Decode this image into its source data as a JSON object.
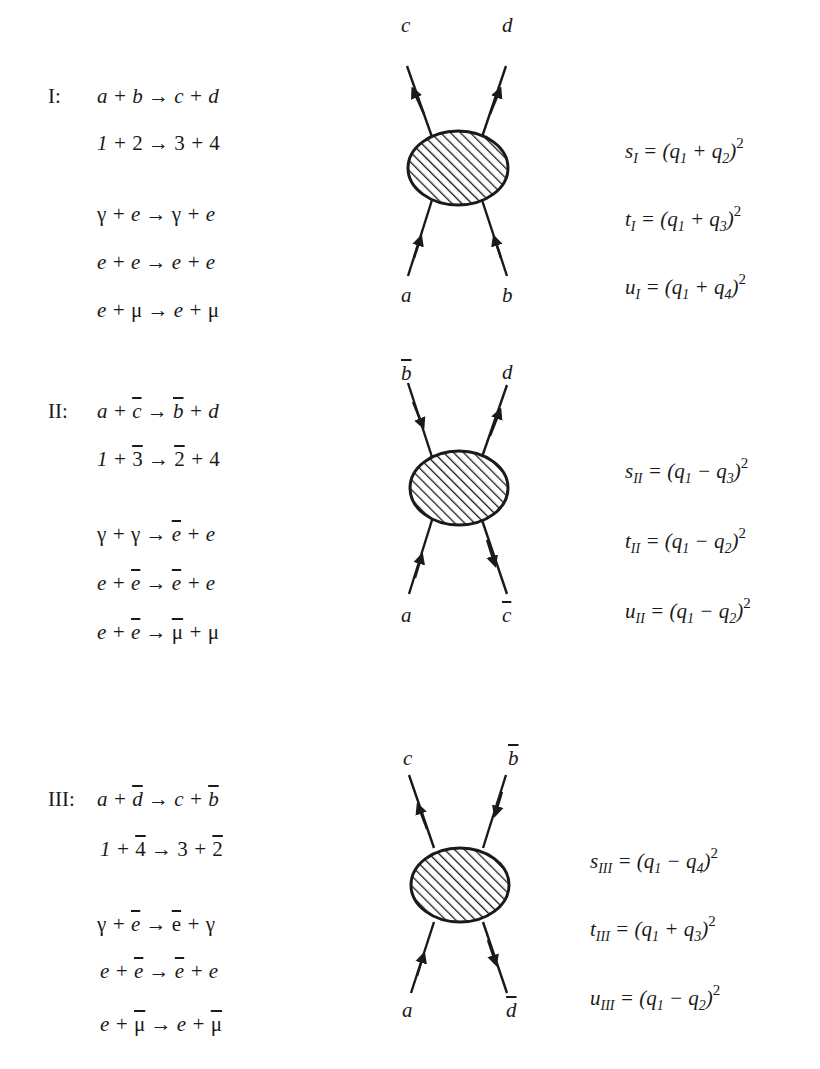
{
  "sections": [
    {
      "id": "I",
      "label": "I:",
      "equations": {
        "generic": "a + b → c + d",
        "numbered": "1 + 2 → 3 + 4",
        "examples": [
          "γ + e → γ + e",
          "e + e → e + e",
          "e + μ → e + μ"
        ]
      },
      "diagram": {
        "top_left": "c",
        "top_right": "d",
        "bottom_left": "a",
        "bottom_right": "b",
        "arrows": {
          "top_left": "out",
          "top_right": "out",
          "bottom_left": "in",
          "bottom_right": "in"
        }
      },
      "mandelstam": {
        "s": {
          "sym": "s",
          "sub": "I",
          "expr": "(q₁ + q₂)²"
        },
        "t": {
          "sym": "t",
          "sub": "I",
          "expr": "(q₁ + q₃)²"
        },
        "u": {
          "sym": "u",
          "sub": "I",
          "expr": "(q₁ + q₄)²"
        }
      }
    },
    {
      "id": "II",
      "label": "II:",
      "equations": {
        "generic": "a + c̄ → b̄ + d",
        "numbered": "1 + 3̄ → 2̄ + 4",
        "examples": [
          "γ + γ → ē + e",
          "e + ē → ē + e",
          "e + ē → μ̄ + μ"
        ]
      },
      "diagram": {
        "top_left": "b̄",
        "top_right": "d",
        "bottom_left": "a",
        "bottom_right": "c̄",
        "arrows": {
          "top_left": "in",
          "top_right": "out",
          "bottom_left": "in",
          "bottom_right": "out"
        }
      },
      "mandelstam": {
        "s": {
          "sym": "s",
          "sub": "II",
          "expr": "(q₁ − q₃)²"
        },
        "t": {
          "sym": "t",
          "sub": "II",
          "expr": "(q₁ − q₂)²"
        },
        "u": {
          "sym": "u",
          "sub": "II",
          "expr": "(q₁ − q₂)²"
        }
      }
    },
    {
      "id": "III",
      "label": "III:",
      "equations": {
        "generic": "a + d̄ → c + b̄",
        "numbered": "1 + 4̄ → 3 + 2̄",
        "examples": [
          "γ + ē → ē + γ",
          "e + ē → ē + e",
          "e + μ̄ → e + μ̄"
        ]
      },
      "diagram": {
        "top_left": "c",
        "top_right": "b̄",
        "bottom_left": "a",
        "bottom_right": "d̄",
        "arrows": {
          "top_left": "out",
          "top_right": "in",
          "bottom_left": "in",
          "bottom_right": "out"
        }
      },
      "mandelstam": {
        "s": {
          "sym": "s",
          "sub": "III",
          "expr": "(q₁ − q₄)²"
        },
        "t": {
          "sym": "t",
          "sub": "III",
          "expr": "(q₁ + q₃)²"
        },
        "u": {
          "sym": "u",
          "sub": "III",
          "expr": "(q₁ − q₂)²"
        }
      }
    }
  ],
  "style": {
    "ink": "#1a1a1a",
    "paper": "#ffffff"
  }
}
